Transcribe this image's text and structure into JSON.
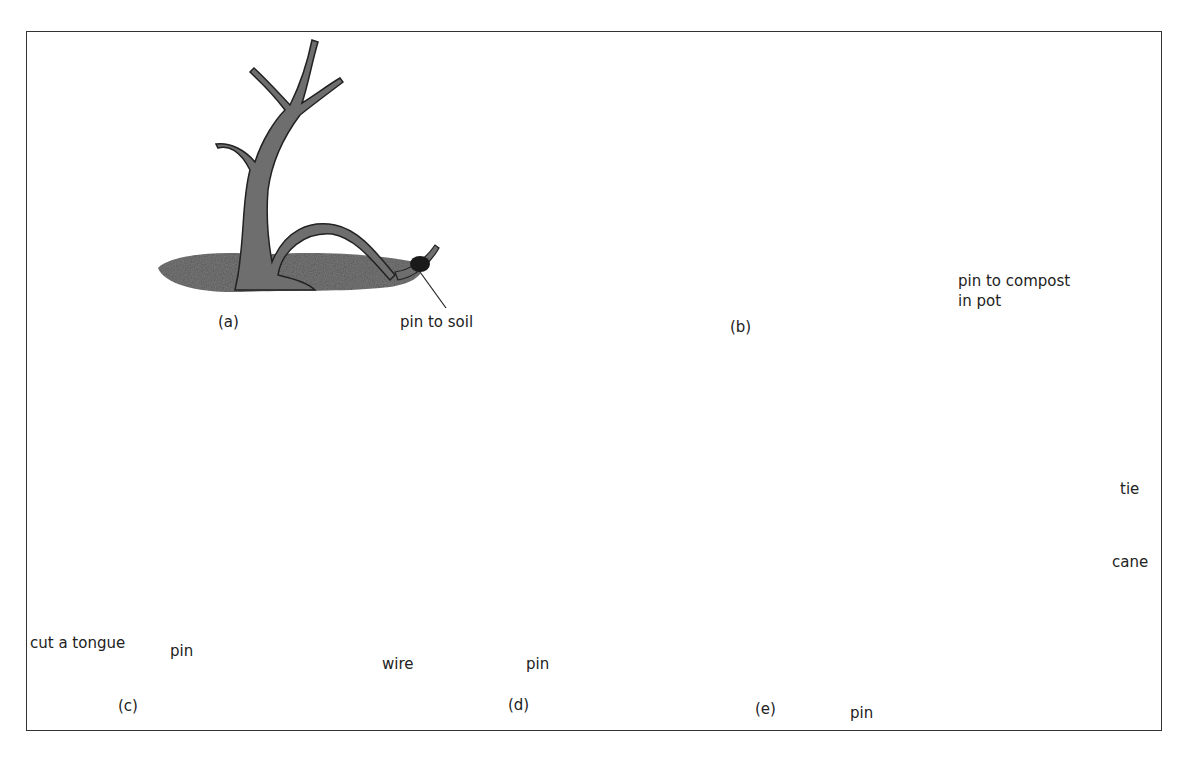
{
  "figure": {
    "panels": [
      {
        "id": "a",
        "caption": "(a)",
        "labels": [
          "pin to soil"
        ]
      },
      {
        "id": "b",
        "caption": "(b)",
        "labels": [
          "pin to compost",
          "in pot"
        ]
      },
      {
        "id": "c",
        "caption": "(c)",
        "labels": [
          "cut a tongue",
          "pin"
        ]
      },
      {
        "id": "d",
        "caption": "(d)",
        "labels": [
          "wire",
          "pin"
        ]
      },
      {
        "id": "e",
        "caption": "(e)",
        "labels": [
          "tie",
          "cane",
          "pin"
        ]
      }
    ]
  },
  "colors": {
    "ink": "#222222",
    "bark": "#6e6e6e",
    "soil": "#7a7a7a",
    "pin": "#1a1a1a",
    "frame": "#333333"
  }
}
